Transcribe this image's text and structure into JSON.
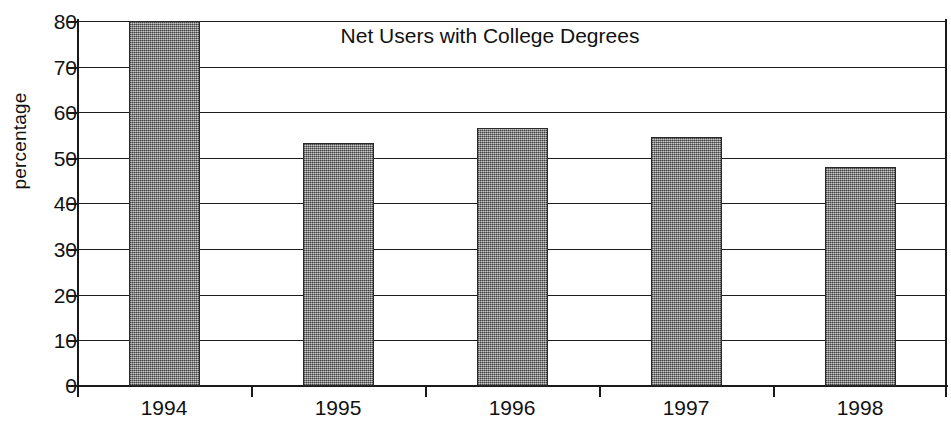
{
  "chart_data": {
    "type": "bar",
    "title": "Net Users with College Degrees",
    "xlabel": "",
    "ylabel": "percentage",
    "categories": [
      "1994",
      "1995",
      "1996",
      "1997",
      "1998"
    ],
    "values": [
      80,
      53.3,
      56.6,
      54.5,
      48
    ],
    "series": [
      {
        "name": "percentage",
        "values": [
          80,
          53.3,
          56.6,
          54.5,
          48
        ]
      }
    ],
    "ylim": [
      0,
      80
    ],
    "yticks": [
      0,
      10,
      20,
      30,
      40,
      50,
      60,
      70,
      80
    ],
    "ytick_labels": [
      "0",
      "10",
      "20",
      "30",
      "40",
      "50",
      "60",
      "70",
      "80"
    ],
    "grid": true,
    "legend": false,
    "legend_position": "none",
    "bar_fill": "#8d8d8d",
    "bar_edge": "#2a2a2a",
    "axis_color": "#1a1a1a",
    "background": "#ffffff"
  },
  "axis": {
    "y_title": "percentage"
  }
}
